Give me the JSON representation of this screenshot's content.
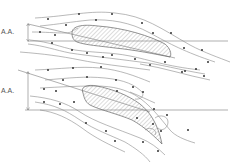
{
  "diagram": {
    "type": "airfoil streamline diagram",
    "panels": [
      {
        "name": "low-angle-of-attack",
        "label": "A.A.",
        "flow": "smooth attached streamlines"
      },
      {
        "name": "high-angle-of-attack",
        "label": "A.A.",
        "flow": "separated turbulent flow over upper surface"
      }
    ]
  },
  "colors": {
    "background": "#ffffff",
    "streamline": "#8a8a8a",
    "outline": "#666666",
    "hatch": "#888888",
    "arrow": "#333333"
  }
}
